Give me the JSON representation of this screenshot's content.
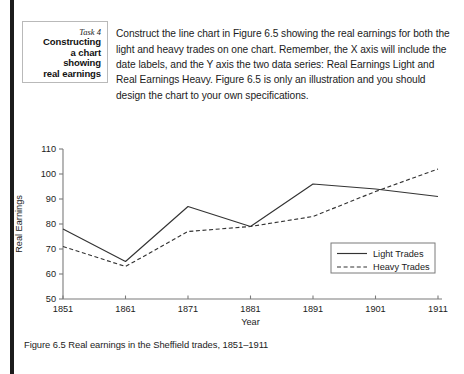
{
  "task_box": {
    "number": "Task 4",
    "lines": [
      "Constructing",
      "a chart",
      "showing",
      "real earnings"
    ]
  },
  "intro": {
    "text": "Construct the line chart in Figure 6.5 showing the real earnings for both the light and heavy trades on one chart. Remember, the X axis will include the date labels, and the Y axis the two data series: Real Earnings Light and Real Earnings Heavy. Figure 6.5 is only an illustration and you should design the chart to your own specifications."
  },
  "caption": {
    "text": "Figure 6.5  Real earnings in the Sheffield trades, 1851–1911"
  },
  "chart_data": {
    "type": "line",
    "title": "",
    "xlabel": "Year",
    "ylabel": "Real Earnings",
    "categories": [
      "1851",
      "1861",
      "1871",
      "1881",
      "1891",
      "1901",
      "1911"
    ],
    "x": [
      1851,
      1861,
      1871,
      1881,
      1891,
      1901,
      1911
    ],
    "ylim": [
      50,
      110
    ],
    "yticks": [
      50,
      60,
      70,
      80,
      90,
      100,
      110
    ],
    "grid": false,
    "legend_position": "inside-bottom-right",
    "series": [
      {
        "name": "Light Trades",
        "style": "solid",
        "color": "#333333",
        "values": [
          78,
          65,
          87,
          79,
          96,
          94,
          91
        ]
      },
      {
        "name": "Heavy Trades",
        "style": "dashed",
        "color": "#333333",
        "values": [
          71,
          63,
          77,
          79,
          83,
          93,
          102
        ]
      }
    ]
  }
}
